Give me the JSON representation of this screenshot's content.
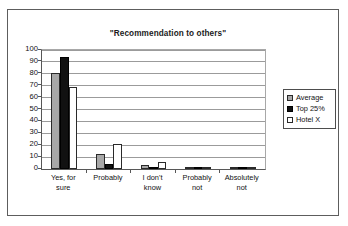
{
  "chart_data": {
    "type": "bar",
    "title": "\"Recommendation to others\"",
    "xlabel": "",
    "ylabel": "",
    "ylim": [
      0,
      100
    ],
    "yticks": [
      0,
      10,
      20,
      30,
      40,
      50,
      60,
      70,
      80,
      90,
      100
    ],
    "grid": "horizontal",
    "legend_position": "right",
    "categories": [
      "Yes, for sure",
      "Probably",
      "I don't know",
      "Probably not",
      "Absolutely not"
    ],
    "category_lines": [
      [
        "Yes, for",
        "sure"
      ],
      [
        "Probably",
        ""
      ],
      [
        "I don't",
        "know"
      ],
      [
        "Probably",
        "not"
      ],
      [
        "Absolutely",
        "not"
      ]
    ],
    "series": [
      {
        "name": "Average",
        "color": "#a8a8a8",
        "values": [
          81,
          13,
          3,
          1,
          1
        ]
      },
      {
        "name": "Top 25%",
        "color": "#111111",
        "values": [
          94,
          4,
          1,
          1,
          1
        ]
      },
      {
        "name": "Hotel X",
        "color": "#ffffff",
        "values": [
          69,
          21,
          6,
          0,
          0
        ]
      }
    ]
  },
  "legend": {
    "items": [
      {
        "label": "Average",
        "swatch": "average-swatch"
      },
      {
        "label": "Top 25%",
        "swatch": "top25-swatch"
      },
      {
        "label": "Hotel X",
        "swatch": "hotelx-swatch"
      }
    ]
  }
}
